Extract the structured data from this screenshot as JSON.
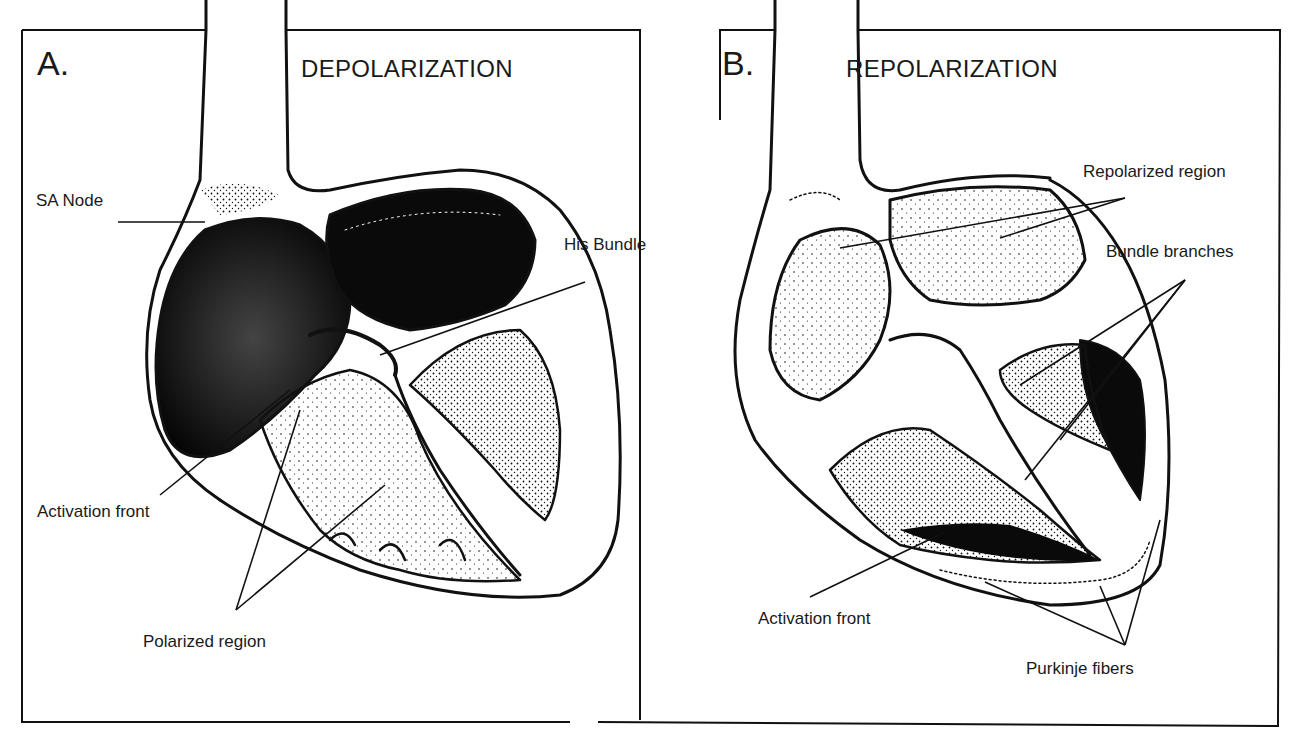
{
  "figure": {
    "panels": [
      {
        "letter": "A.",
        "title": "DEPOLARIZATION",
        "labels": {
          "sa_node": "SA Node",
          "his_bundle": "His Bundle",
          "activation_front": "Activation front",
          "polarized_region": "Polarized region"
        }
      },
      {
        "letter": "B.",
        "title": "REPOLARIZATION",
        "labels": {
          "repolarized_region": "Repolarized region",
          "bundle_branches": "Bundle branches",
          "activation_front": "Activation front",
          "purkinje_fibers": "Purkinje fibers"
        }
      }
    ],
    "colors": {
      "ink": "#111111",
      "paper": "#ffffff"
    }
  }
}
